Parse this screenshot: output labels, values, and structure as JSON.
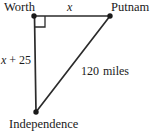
{
  "figure": {
    "type": "right-triangle-diagram",
    "stroke_color": "#2b2b2b",
    "background": "#ffffff"
  },
  "vertices": [
    {
      "id": "worth",
      "label": "Worth",
      "x": 34,
      "y": 16,
      "dot": true
    },
    {
      "id": "putnam",
      "label": "Putnam",
      "x": 110,
      "y": 16,
      "dot": true
    },
    {
      "id": "independence",
      "label": "Independence",
      "x": 36,
      "y": 112,
      "dot": true
    }
  ],
  "sides": {
    "top": {
      "label_variable": "x",
      "label_text": "x"
    },
    "left": {
      "label_variable": "x",
      "label_text": "x + 25",
      "operator": "+",
      "constant": "25"
    },
    "hypotenuse": {
      "value": "120",
      "unit": "miles",
      "label_text": "120  miles"
    }
  },
  "right_angle": {
    "at": "worth",
    "size": 11
  }
}
